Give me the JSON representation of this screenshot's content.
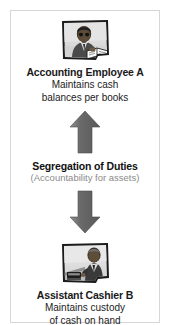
{
  "diagram": {
    "title": "Segregation of Duties",
    "subtitle": "(Accountability for assets)",
    "frame_color": "#d6d6d6",
    "arrow_color": "#6e6e6e",
    "subtitle_color": "#8a8a8a",
    "text_color": "#1a1a1a",
    "top_node": {
      "icon": "photo-accounting-employee-icon",
      "title": "Accounting Employee A",
      "desc_line1": "Maintains cash",
      "desc_line2": "balances per books"
    },
    "bottom_node": {
      "icon": "photo-assistant-cashier-icon",
      "title": "Assistant Cashier B",
      "desc_line1": "Maintains custody",
      "desc_line2": "of cash on hand"
    },
    "arrow_up": "arrow-up-icon",
    "arrow_down": "arrow-down-icon"
  }
}
